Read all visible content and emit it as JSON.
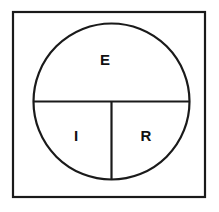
{
  "diagram": {
    "type": "ohms-law-circle",
    "background_color": "#ffffff",
    "line_color": "#1a1a1a",
    "text_color": "#111111",
    "frame": {
      "name": "outer-frame",
      "x": 13,
      "y": 12,
      "width": 192,
      "height": 185,
      "stroke_width": 2.2
    },
    "circle": {
      "name": "main-circle",
      "center_x": 111.5,
      "center_y": 101.5,
      "radius": 78,
      "stroke_width": 2.2
    },
    "lines": [
      {
        "name": "horizontal-diameter",
        "x1": 33.5,
        "y1": 101.5,
        "x2": 189.5,
        "y2": 101.5
      },
      {
        "name": "vertical-radius",
        "x1": 111.5,
        "y1": 101.5,
        "x2": 111.5,
        "y2": 179.5
      }
    ],
    "sectors": [
      {
        "id": "E",
        "label": "E",
        "name": "sector-label-e",
        "position": "top-half",
        "label_x": 105,
        "label_y": 61
      },
      {
        "id": "I",
        "label": "I",
        "name": "sector-label-i",
        "position": "bottom-left-quarter",
        "label_x": 76,
        "label_y": 137
      },
      {
        "id": "R",
        "label": "R",
        "name": "sector-label-r",
        "position": "bottom-right-quarter",
        "label_x": 146,
        "label_y": 137
      }
    ]
  }
}
